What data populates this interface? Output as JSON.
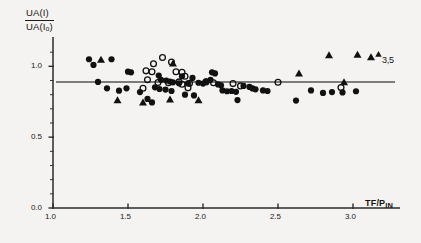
{
  "chart_data": {
    "type": "scatter",
    "title": "",
    "subtitle": "",
    "xlabel": "TF/P_IN",
    "xlabel_main": "TF/P",
    "xlabel_sub": "IN",
    "ylabel": "UA (I) / UA (I_o)",
    "ylabel_numerator": "UA",
    "ylabel_numerator_paren": "(I)",
    "ylabel_denominator": "UA",
    "ylabel_denominator_paren": "(I",
    "ylabel_denominator_sub": "o",
    "ylabel_denominator_close": ")",
    "xlim": [
      1.0,
      3.3
    ],
    "ylim": [
      0.0,
      1.2
    ],
    "xticks": [
      1.0,
      1.5,
      2.0,
      2.5,
      3.0
    ],
    "xticklabels": [
      "1.0",
      "1.5",
      "2.0",
      "2.5",
      "3.0"
    ],
    "yticks": [
      0.0,
      0.5,
      1.0
    ],
    "yticklabels": [
      "0.0",
      "0.5",
      "1.0"
    ],
    "yminorticks": [
      0.1,
      0.2,
      0.3,
      0.4,
      0.6,
      0.7,
      0.8,
      0.9,
      1.1
    ],
    "grid": false,
    "legend": false,
    "reference_line": {
      "type": "horizontal",
      "y": 0.89,
      "x_start": 1.02,
      "x_end": 3.28,
      "color": "#555555"
    },
    "annotations": [
      {
        "text": "3,5",
        "marker": "triangle",
        "x": 3.17,
        "y": 1.085
      }
    ],
    "series": [
      {
        "name": "filled-circle",
        "marker": "filled-circle",
        "color": "#111111",
        "points": [
          [
            1.24,
            1.05
          ],
          [
            1.27,
            1.01
          ],
          [
            1.39,
            1.05
          ],
          [
            1.3,
            0.89
          ],
          [
            1.36,
            0.845
          ],
          [
            1.44,
            0.828
          ],
          [
            1.5,
            0.962
          ],
          [
            1.52,
            0.958
          ],
          [
            1.49,
            0.845
          ],
          [
            1.58,
            0.818
          ],
          [
            1.63,
            0.77
          ],
          [
            1.705,
            0.935
          ],
          [
            1.72,
            0.905
          ],
          [
            1.755,
            0.9
          ],
          [
            1.78,
            0.893
          ],
          [
            1.8,
            0.887
          ],
          [
            1.84,
            0.88
          ],
          [
            1.86,
            0.93
          ],
          [
            1.68,
            0.852
          ],
          [
            1.71,
            0.84
          ],
          [
            1.75,
            0.836
          ],
          [
            1.79,
            0.826
          ],
          [
            1.9,
            0.88
          ],
          [
            1.93,
            0.918
          ],
          [
            1.97,
            0.884
          ],
          [
            2.0,
            0.878
          ],
          [
            2.02,
            0.893
          ],
          [
            2.05,
            0.905
          ],
          [
            2.06,
            0.958
          ],
          [
            2.08,
            0.95
          ],
          [
            2.1,
            0.872
          ],
          [
            2.12,
            0.866
          ],
          [
            2.13,
            0.83
          ],
          [
            2.16,
            0.824
          ],
          [
            2.19,
            0.826
          ],
          [
            2.22,
            0.82
          ],
          [
            2.27,
            0.862
          ],
          [
            2.31,
            0.855
          ],
          [
            2.33,
            0.844
          ],
          [
            2.35,
            0.838
          ],
          [
            1.88,
            0.8
          ],
          [
            1.94,
            0.795
          ],
          [
            2.4,
            0.83
          ],
          [
            2.43,
            0.826
          ],
          [
            2.62,
            0.758
          ],
          [
            2.72,
            0.83
          ],
          [
            2.8,
            0.812
          ],
          [
            2.86,
            0.818
          ],
          [
            2.93,
            0.816
          ],
          [
            3.02,
            0.824
          ],
          [
            1.66,
            0.745
          ],
          [
            2.23,
            0.762
          ]
        ]
      },
      {
        "name": "open-circle",
        "marker": "open-circle",
        "color": "#111111",
        "points": [
          [
            1.67,
            1.018
          ],
          [
            1.73,
            1.062
          ],
          [
            1.79,
            1.03
          ],
          [
            1.62,
            0.968
          ],
          [
            1.66,
            0.962
          ],
          [
            1.82,
            0.962
          ],
          [
            1.86,
            0.958
          ],
          [
            1.88,
            0.93
          ],
          [
            1.63,
            0.905
          ],
          [
            1.7,
            0.886
          ],
          [
            1.77,
            0.884
          ],
          [
            1.84,
            0.89
          ],
          [
            1.86,
            0.874
          ],
          [
            1.91,
            0.88
          ],
          [
            1.6,
            0.845
          ],
          [
            1.9,
            0.848
          ],
          [
            2.07,
            0.884
          ],
          [
            2.2,
            0.878
          ],
          [
            2.25,
            0.862
          ],
          [
            2.5,
            0.888
          ],
          [
            2.92,
            0.85
          ],
          [
            2.02,
            0.89
          ]
        ]
      },
      {
        "name": "filled-triangle",
        "marker": "filled-triangle",
        "color": "#111111",
        "points": [
          [
            1.32,
            1.046
          ],
          [
            1.43,
            0.76
          ],
          [
            1.6,
            0.745
          ],
          [
            1.8,
            1.02
          ],
          [
            1.78,
            0.766
          ],
          [
            1.97,
            0.76
          ],
          [
            2.64,
            0.95
          ],
          [
            2.84,
            1.078
          ],
          [
            3.03,
            1.082
          ],
          [
            2.94,
            0.888
          ],
          [
            3.12,
            1.065
          ]
        ]
      }
    ]
  },
  "axes": {
    "y_axis_name": "y-axis",
    "x_axis_name": "x-axis"
  }
}
